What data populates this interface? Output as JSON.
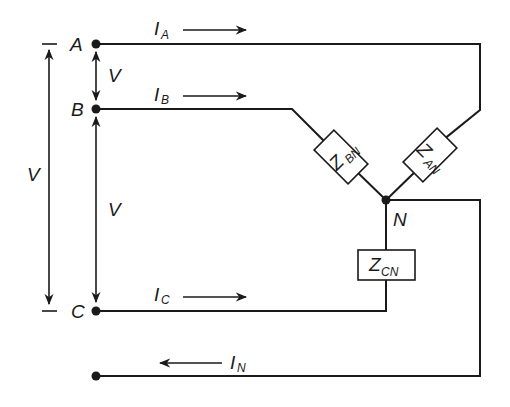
{
  "diagram": {
    "type": "three-phase wye-connected load with neutral",
    "nodes": {
      "A": "A",
      "B": "B",
      "C": "C",
      "N": "N"
    },
    "voltages": {
      "v_ab": "V",
      "v_bc": "V",
      "v_ac": "V"
    },
    "currents": {
      "ia_main": "I",
      "ia_sub": "A",
      "ib_main": "I",
      "ib_sub": "B",
      "ic_main": "I",
      "ic_sub": "C",
      "in_main": "I",
      "in_sub": "N"
    },
    "impedances": {
      "zbn_main": "Z",
      "zbn_sub": "BN",
      "zan_main": "Z",
      "zan_sub": "AN",
      "zcn_main": "Z",
      "zcn_sub": "CN"
    },
    "colors": {
      "line": "#1a1a1a",
      "background": "#ffffff"
    }
  }
}
